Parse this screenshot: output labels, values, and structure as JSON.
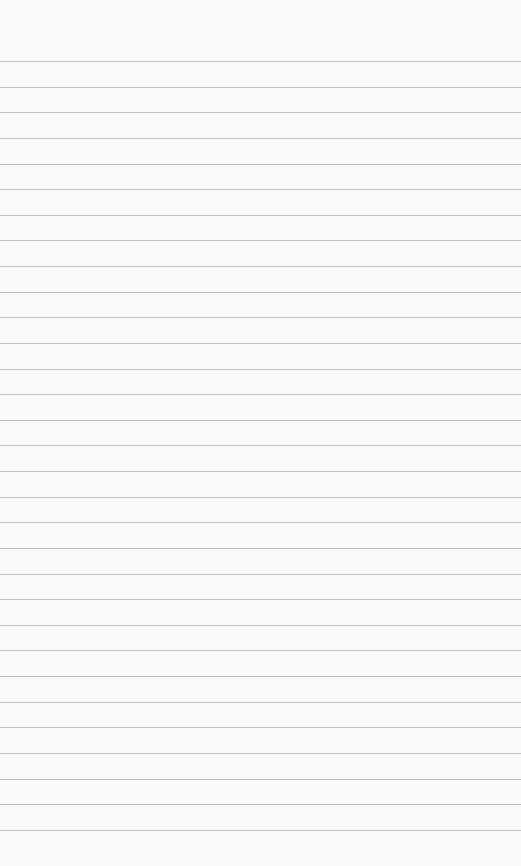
{
  "paper": {
    "background_color": "#f9f9f9",
    "line_color": "#b8b8b8",
    "first_line_y": 61,
    "line_spacing": 25.63,
    "line_count": 31
  }
}
